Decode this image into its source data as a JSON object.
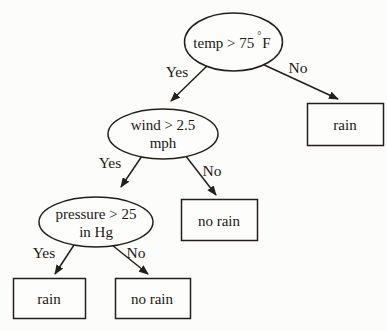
{
  "diagram": {
    "type": "decision-tree",
    "topic": "rain prediction decision tree",
    "colors": {
      "background": "#fcfcfa",
      "stroke": "#241f1a",
      "text": "#1c1712",
      "node_fill": "#fdfdfc"
    },
    "nodes": {
      "temp": {
        "shape": "ellipse",
        "label": "temp > 75 °F",
        "text": "temp > 75",
        "sup": "°",
        "after_sup": "F"
      },
      "wind": {
        "shape": "ellipse",
        "label": "wind > 2.5 mph",
        "line1": "wind > 2.5",
        "line2": "mph"
      },
      "pressure": {
        "shape": "ellipse",
        "label": "pressure > 25 in Hg",
        "line1": "pressure > 25",
        "line2": "in Hg"
      },
      "rain_right": {
        "shape": "rect",
        "label": "rain"
      },
      "no_rain_mid": {
        "shape": "rect",
        "label": "no rain"
      },
      "rain_left": {
        "shape": "rect",
        "label": "rain"
      },
      "no_rain_bottom": {
        "shape": "rect",
        "label": "no rain"
      }
    },
    "edges": {
      "temp_yes": {
        "label": "Yes",
        "from": "temp",
        "to": "wind"
      },
      "temp_no": {
        "label": "No",
        "from": "temp",
        "to": "rain_right"
      },
      "wind_yes": {
        "label": "Yes",
        "from": "wind",
        "to": "pressure"
      },
      "wind_no": {
        "label": "No",
        "from": "wind",
        "to": "no_rain_mid"
      },
      "pressure_yes": {
        "label": "Yes",
        "from": "pressure",
        "to": "rain_left"
      },
      "pressure_no": {
        "label": "No",
        "from": "pressure",
        "to": "no_rain_bottom"
      }
    }
  }
}
